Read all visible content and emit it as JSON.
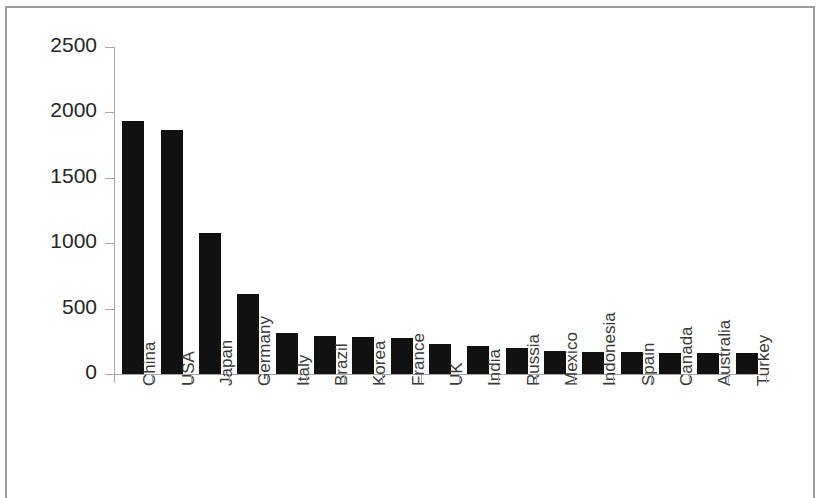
{
  "chart_data": {
    "type": "bar",
    "title": "",
    "subtitle": "",
    "xlabel": "",
    "ylabel": "",
    "ylim": [
      0,
      2500
    ],
    "ytick_values": [
      0,
      500,
      1000,
      1500,
      2000,
      2500
    ],
    "ytick_labels": [
      "0",
      "500",
      "1000",
      "1500",
      "2000",
      "2500"
    ],
    "grid": false,
    "legend": null,
    "bar_color": "#111111",
    "axis_color": "#a6a6a6",
    "categories": [
      "China",
      "USA",
      "Japan",
      "Germany",
      "Italy",
      "Brazil",
      "Korea",
      "France",
      "UK",
      "India",
      "Russia",
      "Mexico",
      "Indonesia",
      "Spain",
      "Canada",
      "Australia",
      "Turkey"
    ],
    "values": [
      1930,
      1860,
      1080,
      610,
      310,
      290,
      285,
      275,
      230,
      210,
      200,
      175,
      170,
      165,
      162,
      160,
      158
    ]
  },
  "figure": {
    "border_color": "#9b9b9b",
    "background": "#ffffff"
  }
}
